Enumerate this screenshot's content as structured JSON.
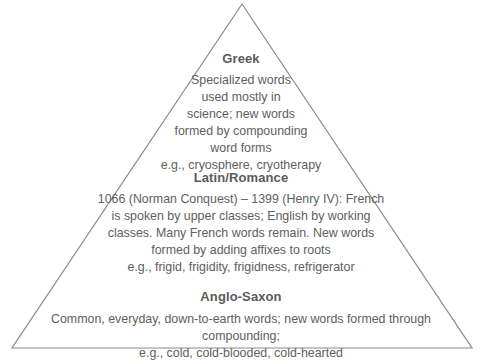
{
  "diagram": {
    "type": "pyramid",
    "shape": {
      "apex": [
        242,
        4
      ],
      "base_left": [
        12,
        348
      ],
      "base_right": [
        472,
        348
      ],
      "stroke_color": "#8a8a8a"
    },
    "tiers": [
      {
        "title": "Greek",
        "lines": [
          "Specialized words",
          "used mostly in",
          "science; new words",
          "formed by compounding",
          "word forms",
          "e.g., cryosphere, cryotherapy"
        ]
      },
      {
        "title": "Latin/Romance",
        "lines": [
          "1066 (Norman Conquest) – 1399 (Henry IV): French",
          "is spoken by upper classes; English by working",
          "classes. Many French words remain. New words",
          "formed by adding affixes to roots",
          "e.g., frigid, frigidity, frigidness, refrigerator"
        ]
      },
      {
        "title": "Anglo-Saxon",
        "lines": [
          "Common, everyday, down-to-earth words; new words formed through",
          "compounding;",
          "e.g., cold, cold-blooded, cold-hearted"
        ]
      }
    ]
  }
}
